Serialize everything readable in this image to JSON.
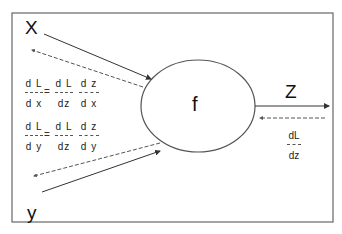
{
  "diagram": {
    "node": {
      "label": "f"
    },
    "inputs": [
      {
        "label": "X"
      },
      {
        "label": "y"
      }
    ],
    "output": {
      "label": "Z"
    },
    "gradients": {
      "dx": {
        "lhs": {
          "num": "d L",
          "den": "d x"
        },
        "eq": "=",
        "t1": {
          "num": "d L",
          "den": "dz"
        },
        "t2": {
          "num": "d z",
          "den": "d x"
        }
      },
      "dy": {
        "lhs": {
          "num": "d L",
          "den": "d y"
        },
        "eq": "=",
        "t1": {
          "num": "d L",
          "den": "dz"
        },
        "t2": {
          "num": "d z",
          "den": "d y"
        }
      },
      "dz": {
        "num": "dL",
        "den": "dz"
      }
    },
    "colors": {
      "line": "#333333",
      "dashed": "#555555",
      "frame": "#555555"
    }
  }
}
